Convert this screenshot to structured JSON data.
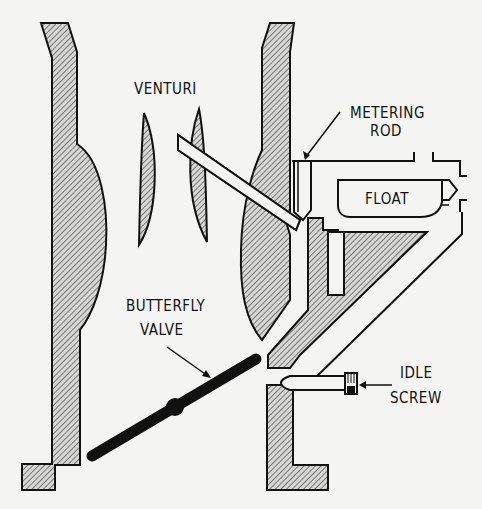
{
  "diagram": {
    "background": "#f4f4f2",
    "ink_color": "#111111",
    "labels": {
      "venturi": "VENTURI",
      "metering_rod_line1": "METERING",
      "metering_rod_line2": "ROD",
      "float": "FLOAT",
      "butterfly_valve_line1": "BUTTERFLY",
      "butterfly_valve_line2": "VALVE",
      "idle_screw_line1": "IDLE",
      "idle_screw_line2": "SCREW"
    },
    "components": [
      "left-throat-wall",
      "right-throat-wall",
      "venturi-left-vane",
      "venturi-right-vane",
      "main-discharge-nozzle",
      "metering-rod",
      "float",
      "float-bowl",
      "float-needle-valve",
      "idle-passage",
      "butterfly-valve",
      "idle-screw"
    ]
  }
}
